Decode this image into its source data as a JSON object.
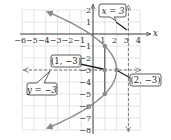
{
  "chart_data": {
    "type": "line",
    "title": "",
    "xlabel": "x",
    "ylabel": "y",
    "xlim": [
      -6,
      4
    ],
    "ylim": [
      -8,
      2
    ],
    "grid": true,
    "x_ticks": [
      "-6",
      "-5",
      "-4",
      "-3",
      "-2",
      "-1",
      "1",
      "2",
      "3",
      "4"
    ],
    "y_ticks": [
      "2",
      "1",
      "-1",
      "-2",
      "-3",
      "-4",
      "-5",
      "-6",
      "-7",
      "-8"
    ],
    "curve": {
      "description": "parabola opening left, x = 2 - (y+3)^2/4",
      "vertex": [
        2,
        -3
      ],
      "color": "#8a8a8a"
    },
    "points": [
      {
        "x": 1,
        "y": -1
      },
      {
        "x": 1,
        "y": -3
      },
      {
        "x": 2,
        "y": -3
      },
      {
        "x": 1,
        "y": -5
      }
    ],
    "lines": [
      {
        "type": "dashed-vertical",
        "x": 3,
        "label": "x = 3"
      },
      {
        "type": "dashed-horizontal",
        "y": -3,
        "label": "y = -3"
      },
      {
        "type": "solid-vertical",
        "x": 1,
        "from_y": -1,
        "to_y": -5
      }
    ],
    "annotations": [
      "x = 3",
      "(1, −3)",
      "(2, −3)",
      "y = −3"
    ]
  },
  "axis": {
    "x_label": "x"
  },
  "callouts": {
    "vline": "x = 3",
    "point1": "(1, −3)",
    "point2": "(2, −3)",
    "hline": "y = −3"
  },
  "ticks": {
    "x": [
      {
        "v": -6,
        "t": "−6"
      },
      {
        "v": -5,
        "t": "−5"
      },
      {
        "v": -4,
        "t": "−4"
      },
      {
        "v": -3,
        "t": "−3"
      },
      {
        "v": -2,
        "t": "−2"
      },
      {
        "v": -1,
        "t": "−1"
      },
      {
        "v": 1,
        "t": "1"
      },
      {
        "v": 2,
        "t": "2"
      },
      {
        "v": 3,
        "t": "3"
      },
      {
        "v": 4,
        "t": "4"
      }
    ],
    "y": [
      {
        "v": 2,
        "t": "2"
      },
      {
        "v": 1,
        "t": "1"
      },
      {
        "v": -1,
        "t": "−1"
      },
      {
        "v": -2,
        "t": "−2"
      },
      {
        "v": -3,
        "t": "−3"
      },
      {
        "v": -4,
        "t": "−4"
      },
      {
        "v": -5,
        "t": "−5"
      },
      {
        "v": -6,
        "t": "−6"
      },
      {
        "v": -7,
        "t": "−7"
      },
      {
        "v": -8,
        "t": "−8"
      }
    ]
  }
}
